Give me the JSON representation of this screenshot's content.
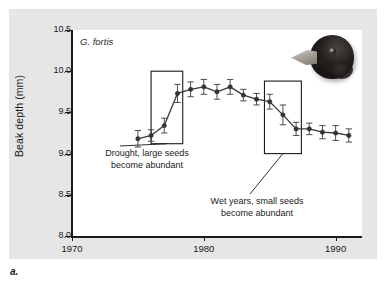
{
  "figure": {
    "caption_label": "a.",
    "species_label": "G. fortis",
    "bird_photo_alt": "medium-ground-finch-head"
  },
  "chart_data": {
    "type": "line",
    "title": "",
    "subtitle": "",
    "xlabel": "",
    "ylabel": "Beak depth (mm)",
    "xlim": [
      1970,
      1992
    ],
    "ylim": [
      8.0,
      10.5
    ],
    "xticks": [
      1970,
      1980,
      1990
    ],
    "yticks": [
      8.0,
      8.5,
      9.0,
      9.5,
      10.0,
      10.5
    ],
    "ytick_labels": [
      "8.0",
      "8.5",
      "9.0",
      "9.5",
      "10.0",
      "10.5"
    ],
    "xtick_labels": [
      "1970",
      "1980",
      "1990"
    ],
    "grid": false,
    "legend": null,
    "series": [
      {
        "name": "G. fortis mean beak depth",
        "marker": "filled-circle",
        "color": "#3a3a3a",
        "error_bars": "vertical",
        "x": [
          1975,
          1976,
          1977,
          1978,
          1979,
          1980,
          1981,
          1982,
          1983,
          1984,
          1985,
          1986,
          1987,
          1988,
          1989,
          1990,
          1991
        ],
        "y": [
          9.18,
          9.22,
          9.34,
          9.73,
          9.78,
          9.81,
          9.75,
          9.81,
          9.71,
          9.66,
          9.63,
          9.47,
          9.3,
          9.3,
          9.26,
          9.25,
          9.22
        ],
        "yerr": [
          0.1,
          0.07,
          0.09,
          0.11,
          0.09,
          0.09,
          0.09,
          0.09,
          0.07,
          0.07,
          0.09,
          0.12,
          0.08,
          0.07,
          0.08,
          0.09,
          0.08
        ]
      }
    ],
    "annotations": [
      {
        "id": "drought",
        "text": "Drought, large seeds\nbecome abundant",
        "highlight_box": {
          "x0": 1976.0,
          "x1": 1978.4,
          "y0": 9.12,
          "y1": 10.0
        }
      },
      {
        "id": "wet",
        "text": "Wet years, small seeds\nbecome abundant",
        "highlight_box": {
          "x0": 1984.6,
          "x1": 1987.4,
          "y0": 9.0,
          "y1": 9.88
        }
      }
    ]
  },
  "colors": {
    "panel_background": "#e6e6e6",
    "plot_background": "#ffffff",
    "axis": "#1a1a1a",
    "line": "#3a3a3a",
    "marker": "#333333",
    "box_outline": "#1a1a1a",
    "text": "#1a1a1a"
  }
}
